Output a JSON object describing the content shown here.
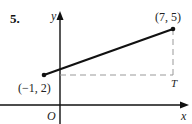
{
  "problem": {
    "number": "5."
  },
  "axes": {
    "x_label": "x",
    "y_label": "y",
    "origin_label": "O"
  },
  "points": [
    {
      "label": "(−1, 2)",
      "x": -1,
      "y": 2
    },
    {
      "label": "(7, 5)",
      "x": 7,
      "y": 5
    }
  ],
  "corner": {
    "label": "T",
    "x": 7,
    "y": 2
  },
  "colors": {
    "ink": "#111111",
    "dashed": "#999999"
  }
}
